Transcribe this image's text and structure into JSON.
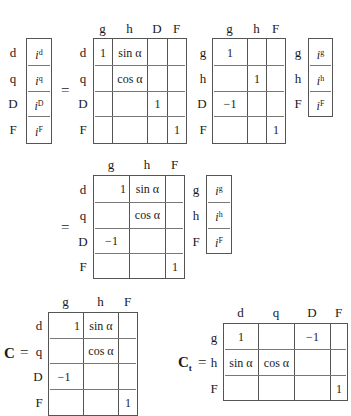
{
  "equation1": {
    "lhs_vector": {
      "row_labels": [
        "d",
        "q",
        "D",
        "F"
      ],
      "entries": [
        "i",
        "i",
        "i",
        "i"
      ],
      "superscripts": [
        "d",
        "q",
        "D",
        "F"
      ]
    },
    "equals": "=",
    "matrix1": {
      "col_labels": [
        "g",
        "h",
        "D",
        "F"
      ],
      "row_labels": [
        "d",
        "q",
        "D",
        "F"
      ],
      "cells": [
        [
          "1",
          "sin α",
          "",
          ""
        ],
        [
          "",
          "cos α",
          "",
          ""
        ],
        [
          "",
          "",
          "1",
          ""
        ],
        [
          "",
          "",
          "",
          "1"
        ]
      ]
    },
    "matrix2": {
      "col_labels": [
        "g",
        "h",
        "F"
      ],
      "row_labels": [
        "g",
        "h",
        "D",
        "F"
      ],
      "cells": [
        [
          "1",
          "",
          ""
        ],
        [
          "",
          "1",
          ""
        ],
        [
          "−1",
          "",
          ""
        ],
        [
          "",
          "",
          "1"
        ]
      ]
    },
    "rhs_vector": {
      "row_labels": [
        "g",
        "h",
        "F"
      ],
      "entries": [
        "i",
        "i",
        "i"
      ],
      "superscripts": [
        "g",
        "h",
        "F"
      ]
    }
  },
  "equation2": {
    "equals": "=",
    "matrix": {
      "col_labels": [
        "g",
        "h",
        "F"
      ],
      "row_labels": [
        "d",
        "q",
        "D",
        "F"
      ],
      "cells": [
        [
          "1",
          "sin α",
          ""
        ],
        [
          "",
          "cos α",
          ""
        ],
        [
          "−1",
          "",
          ""
        ],
        [
          "",
          "",
          "1"
        ]
      ]
    },
    "vector": {
      "row_labels": [
        "g",
        "h",
        "F"
      ],
      "entries": [
        "i",
        "i",
        "i"
      ],
      "superscripts": [
        "g",
        "h",
        "F"
      ]
    }
  },
  "matrix_C": {
    "name": "C",
    "equals": "=",
    "col_labels": [
      "g",
      "h",
      "F"
    ],
    "row_labels": [
      "d",
      "q",
      "D",
      "F"
    ],
    "cells": [
      [
        "1",
        "sin α",
        ""
      ],
      [
        "",
        "cos α",
        ""
      ],
      [
        "−1",
        "",
        ""
      ],
      [
        "",
        "",
        "1"
      ]
    ]
  },
  "matrix_Ct": {
    "name": "C",
    "subscript": "t",
    "equals": "=",
    "col_labels": [
      "d",
      "q",
      "D",
      "F"
    ],
    "row_labels": [
      "g",
      "h",
      "F"
    ],
    "cells": [
      [
        "1",
        "",
        "−1",
        ""
      ],
      [
        "sin α",
        "cos α",
        "",
        ""
      ],
      [
        "",
        "",
        "",
        "1"
      ]
    ]
  }
}
